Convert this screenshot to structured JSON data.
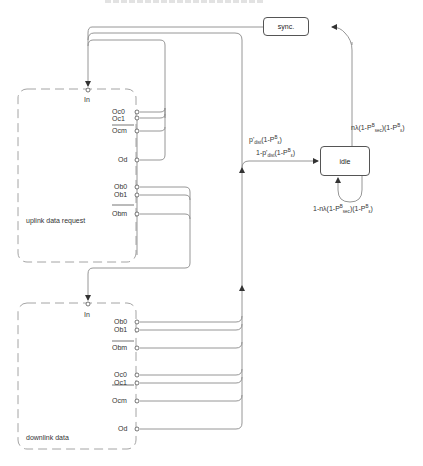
{
  "diagram": {
    "type": "state-transition",
    "states": {
      "sync": {
        "label": "sync."
      },
      "idle": {
        "label": "idle"
      }
    },
    "blocks": {
      "uplink": {
        "name": "uplink data request",
        "input": "In",
        "outputs": [
          "Oc0",
          "Oc1",
          "Ocm",
          "Od",
          "Ob0",
          "Ob1",
          "Obm"
        ]
      },
      "downlink": {
        "name": "downlink data",
        "input": "In",
        "outputs": [
          "Ob0",
          "Ob1",
          "Obm",
          "Oc0",
          "Oc1",
          "Ocm",
          "Od"
        ]
      }
    },
    "transitions": {
      "to_idle_a": {
        "base": "p'",
        "sub": "dist",
        "tail": "(1-P",
        "sup2": "B",
        "sub2": "ε",
        "end": ")"
      },
      "to_idle_b": {
        "base": "1-p'",
        "sub": "dist",
        "tail": "(1-P",
        "sup2": "B",
        "sub2": "ε",
        "end": ")"
      },
      "idle_to_sync": {
        "text1": "nλ(1-P",
        "sup1": "B",
        "sub1": "sec",
        "text2": ")(1-P",
        "sup2": "B",
        "sub2": "ε",
        "end": ")"
      },
      "idle_self": {
        "text1": "1-nλ(1-P",
        "sup1": "B",
        "sub1": "sec",
        "text2": ")(1-P",
        "sup2": "B",
        "sub2": "ε",
        "end": ")"
      }
    }
  },
  "colors": {
    "line": "#8a8a8a",
    "dashed_border": "#9a9a9a",
    "text": "#333333"
  }
}
